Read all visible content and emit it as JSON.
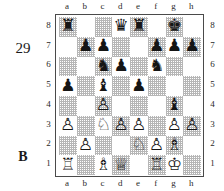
{
  "diagram": {
    "number": "29",
    "side_to_move_label": "B",
    "files_top": [
      "a",
      "b",
      "c",
      "d",
      "e",
      "f",
      "g",
      "h"
    ],
    "files_bottom": [
      "a",
      "b",
      "c",
      "d",
      "e",
      "f",
      "g",
      "h"
    ],
    "ranks_left": [
      "8",
      "7",
      "6",
      "5",
      "4",
      "3",
      "2",
      "1"
    ],
    "ranks_right": [
      "8",
      "7",
      "6",
      "5",
      "4",
      "3",
      "2",
      "1"
    ],
    "colors": {
      "light_square": "#ffffff",
      "dark_square": "#b6b6b6",
      "border": "#4a4a4a",
      "piece": "#151515",
      "text": "#1a1a1a"
    },
    "board": {
      "orientation": "white-bottom",
      "rows": [
        {
          "rank": "8",
          "squares": [
            {
              "square": "a8",
              "shade": "dark",
              "piece": "black-rook",
              "glyph": "♜"
            },
            {
              "square": "b8",
              "shade": "light",
              "piece": null,
              "glyph": ""
            },
            {
              "square": "c8",
              "shade": "dark",
              "piece": null,
              "glyph": ""
            },
            {
              "square": "d8",
              "shade": "light",
              "piece": "black-queen",
              "glyph": "♛"
            },
            {
              "square": "e8",
              "shade": "dark",
              "piece": "black-rook",
              "glyph": "♜"
            },
            {
              "square": "f8",
              "shade": "light",
              "piece": null,
              "glyph": ""
            },
            {
              "square": "g8",
              "shade": "dark",
              "piece": "black-king",
              "glyph": "♚"
            },
            {
              "square": "h8",
              "shade": "light",
              "piece": null,
              "glyph": ""
            }
          ]
        },
        {
          "rank": "7",
          "squares": [
            {
              "square": "a7",
              "shade": "light",
              "piece": null,
              "glyph": ""
            },
            {
              "square": "b7",
              "shade": "dark",
              "piece": "black-pawn",
              "glyph": "♟"
            },
            {
              "square": "c7",
              "shade": "light",
              "piece": "black-pawn",
              "glyph": "♟"
            },
            {
              "square": "d7",
              "shade": "dark",
              "piece": null,
              "glyph": ""
            },
            {
              "square": "e7",
              "shade": "light",
              "piece": null,
              "glyph": ""
            },
            {
              "square": "f7",
              "shade": "dark",
              "piece": "black-pawn",
              "glyph": "♟"
            },
            {
              "square": "g7",
              "shade": "light",
              "piece": "black-pawn",
              "glyph": "♟"
            },
            {
              "square": "h7",
              "shade": "dark",
              "piece": "black-pawn",
              "glyph": "♟"
            }
          ]
        },
        {
          "rank": "6",
          "squares": [
            {
              "square": "a6",
              "shade": "dark",
              "piece": null,
              "glyph": ""
            },
            {
              "square": "b6",
              "shade": "light",
              "piece": null,
              "glyph": ""
            },
            {
              "square": "c6",
              "shade": "dark",
              "piece": "black-knight",
              "glyph": "♞"
            },
            {
              "square": "d6",
              "shade": "light",
              "piece": "black-pawn",
              "glyph": "♟"
            },
            {
              "square": "e6",
              "shade": "dark",
              "piece": null,
              "glyph": ""
            },
            {
              "square": "f6",
              "shade": "light",
              "piece": "black-knight",
              "glyph": "♞"
            },
            {
              "square": "g6",
              "shade": "dark",
              "piece": null,
              "glyph": ""
            },
            {
              "square": "h6",
              "shade": "light",
              "piece": null,
              "glyph": ""
            }
          ]
        },
        {
          "rank": "5",
          "squares": [
            {
              "square": "a5",
              "shade": "light",
              "piece": "black-pawn",
              "glyph": "♟"
            },
            {
              "square": "b5",
              "shade": "dark",
              "piece": null,
              "glyph": ""
            },
            {
              "square": "c5",
              "shade": "light",
              "piece": "black-bishop",
              "glyph": "♝"
            },
            {
              "square": "d5",
              "shade": "dark",
              "piece": null,
              "glyph": ""
            },
            {
              "square": "e5",
              "shade": "light",
              "piece": "black-pawn",
              "glyph": "♟"
            },
            {
              "square": "f5",
              "shade": "dark",
              "piece": null,
              "glyph": ""
            },
            {
              "square": "g5",
              "shade": "light",
              "piece": null,
              "glyph": ""
            },
            {
              "square": "h5",
              "shade": "dark",
              "piece": null,
              "glyph": ""
            }
          ]
        },
        {
          "rank": "4",
          "squares": [
            {
              "square": "a4",
              "shade": "dark",
              "piece": null,
              "glyph": ""
            },
            {
              "square": "b4",
              "shade": "light",
              "piece": null,
              "glyph": ""
            },
            {
              "square": "c4",
              "shade": "dark",
              "piece": "white-pawn",
              "glyph": "♙"
            },
            {
              "square": "d4",
              "shade": "light",
              "piece": null,
              "glyph": ""
            },
            {
              "square": "e4",
              "shade": "dark",
              "piece": null,
              "glyph": ""
            },
            {
              "square": "f4",
              "shade": "light",
              "piece": null,
              "glyph": ""
            },
            {
              "square": "g4",
              "shade": "dark",
              "piece": "black-bishop",
              "glyph": "♝"
            },
            {
              "square": "h4",
              "shade": "light",
              "piece": null,
              "glyph": ""
            }
          ]
        },
        {
          "rank": "3",
          "squares": [
            {
              "square": "a3",
              "shade": "light",
              "piece": "white-pawn",
              "glyph": "♙"
            },
            {
              "square": "b3",
              "shade": "dark",
              "piece": null,
              "glyph": ""
            },
            {
              "square": "c3",
              "shade": "light",
              "piece": "white-knight",
              "glyph": "♘"
            },
            {
              "square": "d3",
              "shade": "dark",
              "piece": "white-pawn",
              "glyph": "♙"
            },
            {
              "square": "e3",
              "shade": "light",
              "piece": "white-pawn",
              "glyph": "♙"
            },
            {
              "square": "f3",
              "shade": "dark",
              "piece": null,
              "glyph": ""
            },
            {
              "square": "g3",
              "shade": "light",
              "piece": "white-pawn",
              "glyph": "♙"
            },
            {
              "square": "h3",
              "shade": "dark",
              "piece": "white-pawn",
              "glyph": "♙"
            }
          ]
        },
        {
          "rank": "2",
          "squares": [
            {
              "square": "a2",
              "shade": "dark",
              "piece": null,
              "glyph": ""
            },
            {
              "square": "b2",
              "shade": "light",
              "piece": "white-pawn",
              "glyph": "♙"
            },
            {
              "square": "c2",
              "shade": "dark",
              "piece": null,
              "glyph": ""
            },
            {
              "square": "d2",
              "shade": "light",
              "piece": null,
              "glyph": ""
            },
            {
              "square": "e2",
              "shade": "dark",
              "piece": "white-knight",
              "glyph": "♘"
            },
            {
              "square": "f2",
              "shade": "light",
              "piece": "white-pawn",
              "glyph": "♙"
            },
            {
              "square": "g2",
              "shade": "dark",
              "piece": "white-bishop",
              "glyph": "♗"
            },
            {
              "square": "h2",
              "shade": "light",
              "piece": null,
              "glyph": ""
            }
          ]
        },
        {
          "rank": "1",
          "squares": [
            {
              "square": "a1",
              "shade": "light",
              "piece": "white-rook",
              "glyph": "♖"
            },
            {
              "square": "b1",
              "shade": "dark",
              "piece": null,
              "glyph": ""
            },
            {
              "square": "c1",
              "shade": "light",
              "piece": "white-bishop",
              "glyph": "♗"
            },
            {
              "square": "d1",
              "shade": "dark",
              "piece": "white-queen",
              "glyph": "♕"
            },
            {
              "square": "e1",
              "shade": "light",
              "piece": null,
              "glyph": ""
            },
            {
              "square": "f1",
              "shade": "dark",
              "piece": "white-rook",
              "glyph": "♖"
            },
            {
              "square": "g1",
              "shade": "light",
              "piece": "white-king",
              "glyph": "♔"
            },
            {
              "square": "h1",
              "shade": "dark",
              "piece": null,
              "glyph": ""
            }
          ]
        }
      ]
    }
  }
}
